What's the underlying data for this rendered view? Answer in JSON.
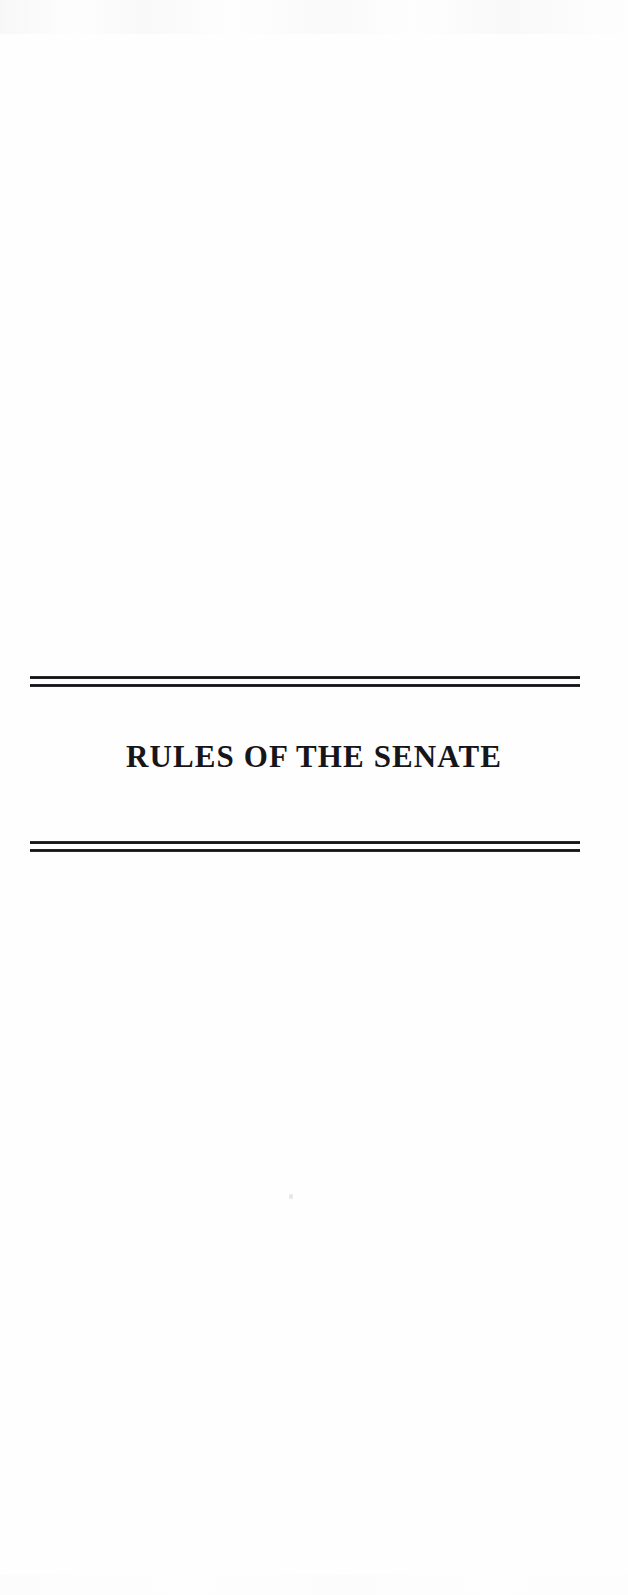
{
  "document": {
    "page_background": "#fefefe",
    "ink_color": "#16161a",
    "section_title": "RULES OF THE SENATE",
    "ornaments": {
      "top_rule": {
        "style": "double-line",
        "lines": 2
      },
      "bottom_rule": {
        "style": "double-line",
        "lines": 2
      }
    },
    "artifacts": {
      "top_noise_band": "scanner-noise",
      "bottom_noise_band": "scanner-noise",
      "speck": "scan-speck"
    }
  }
}
